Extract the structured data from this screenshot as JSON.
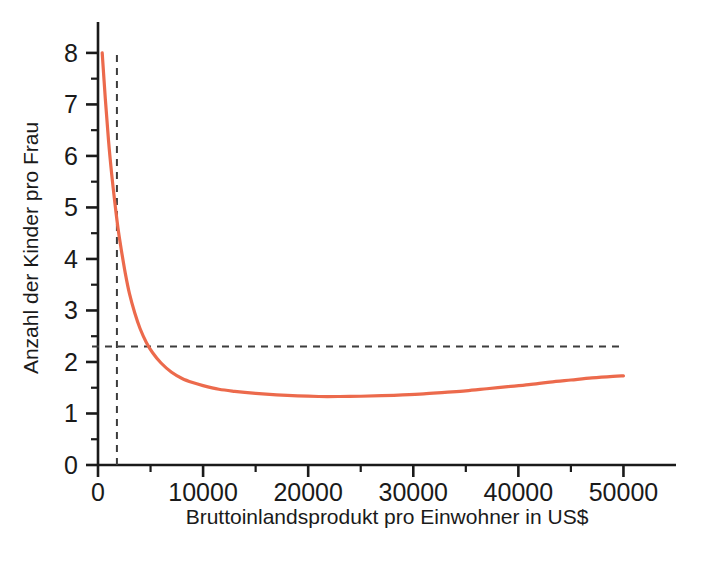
{
  "figure": {
    "width": 703,
    "height": 575,
    "background": "#ffffff"
  },
  "chart_data": {
    "type": "line",
    "title": "",
    "subtitle": "",
    "xlabel": "Bruttoinlandsprodukt pro Einwohner in US$",
    "ylabel": "Anzahl der Kinder pro Frau",
    "xlim": [
      0,
      55000
    ],
    "ylim": [
      0,
      8.6
    ],
    "grid": false,
    "legend": null,
    "legend_position": "none",
    "x_ticks_major": [
      0,
      10000,
      20000,
      30000,
      40000,
      50000
    ],
    "x_tick_labels": [
      "0",
      "10000",
      "20000",
      "30000",
      "40000",
      "50000"
    ],
    "x_ticks_minor": [
      5000,
      15000,
      25000,
      35000,
      45000
    ],
    "y_ticks_major": [
      0,
      1,
      2,
      3,
      4,
      5,
      6,
      7,
      8
    ],
    "y_tick_labels": [
      "0",
      "1",
      "2",
      "3",
      "4",
      "5",
      "6",
      "7",
      "8"
    ],
    "y_ticks_minor": [
      0.5,
      1.5,
      2.5,
      3.5,
      4.5,
      5.5,
      6.5,
      7.5
    ],
    "series": [
      {
        "name": "Fertilitaetsrate",
        "color": "#ec6a4c",
        "linewidth": 3.2,
        "x": [
          400,
          700,
          1000,
          1300,
          1600,
          1900,
          2200,
          2600,
          3000,
          3500,
          4000,
          4600,
          5200,
          6000,
          7000,
          8000,
          9000,
          10000,
          11500,
          13000,
          15000,
          17000,
          19000,
          21000,
          23000,
          25000,
          27000,
          29000,
          31000,
          33000,
          35000,
          37000,
          39000,
          41000,
          43000,
          45000,
          47000,
          49000,
          50000
        ],
        "y": [
          8.0,
          7.1,
          6.3,
          5.65,
          5.1,
          4.6,
          4.2,
          3.72,
          3.32,
          2.95,
          2.65,
          2.38,
          2.18,
          1.98,
          1.8,
          1.68,
          1.6,
          1.54,
          1.47,
          1.43,
          1.39,
          1.36,
          1.34,
          1.33,
          1.33,
          1.335,
          1.345,
          1.36,
          1.38,
          1.41,
          1.44,
          1.48,
          1.52,
          1.56,
          1.61,
          1.65,
          1.69,
          1.72,
          1.73
        ]
      }
    ],
    "annotations": [
      {
        "name": "vertical-threshold",
        "kind": "vline",
        "value": 1800,
        "style": "dashed",
        "color": "#3c3c3c",
        "label": ""
      },
      {
        "name": "replacement-level",
        "kind": "hline",
        "value": 2.3,
        "style": "dashed",
        "color": "#3c3c3c",
        "label": ""
      }
    ]
  }
}
